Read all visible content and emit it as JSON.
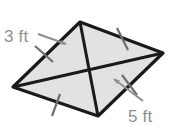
{
  "figure": {
    "shape_type": "rhombus",
    "fill_color": "#e2e2e2",
    "stroke_color": "#1a1a1a",
    "label_color": "#8f8f8f",
    "background_color": "#ffffff",
    "vertices": {
      "top": {
        "x": 80,
        "y": 22
      },
      "right": {
        "x": 163,
        "y": 53
      },
      "bottom": {
        "x": 98,
        "y": 116
      },
      "left": {
        "x": 13,
        "y": 87
      }
    },
    "diagonals": [
      {
        "name": "diagonal-top-bottom",
        "from": "top",
        "to": "bottom"
      },
      {
        "name": "diagonal-left-right",
        "from": "left",
        "to": "right"
      }
    ],
    "side_tick_marks": [
      {
        "name": "tick-upper-left",
        "side": "left-top",
        "x1": 35,
        "y1": 46,
        "x2": 53,
        "y2": 62
      },
      {
        "name": "tick-upper-right",
        "side": "top-right",
        "x1": 117,
        "y1": 28,
        "x2": 128,
        "y2": 50
      },
      {
        "name": "tick-lower-left",
        "side": "left-bottom",
        "x1": 60,
        "y1": 94,
        "x2": 52,
        "y2": 116
      },
      {
        "name": "tick-lower-right",
        "side": "bottom-right",
        "x1": 122,
        "y1": 75,
        "x2": 137,
        "y2": 95
      }
    ],
    "labels": [
      {
        "name": "label-3ft",
        "text": "3 ft",
        "x": 4,
        "y": 42,
        "leader": {
          "from_x": 38,
          "from_y": 34,
          "to_x": 68,
          "to_y": 45
        }
      },
      {
        "name": "label-5ft",
        "text": "5 ft",
        "x": 128,
        "y": 122,
        "leader": {
          "from_x": 143,
          "from_y": 101,
          "to_x": 112,
          "to_y": 78
        }
      }
    ]
  }
}
